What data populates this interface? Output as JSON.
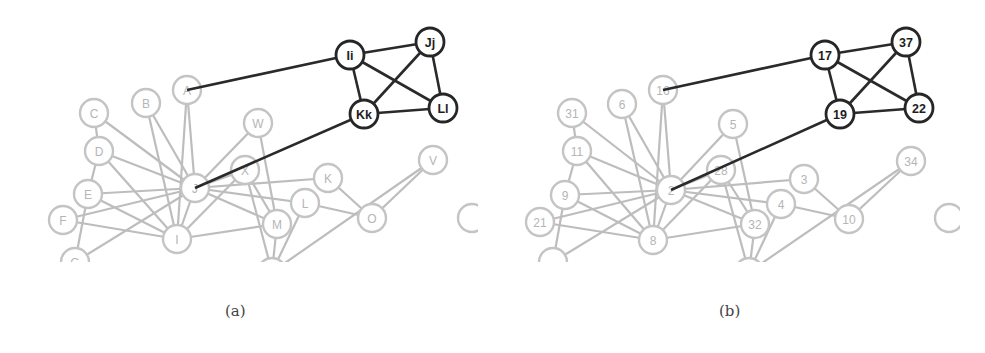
{
  "figure": {
    "colors": {
      "highlight": "#262626",
      "muted": "#c4c4c4",
      "muted_text": "#b5b5b5"
    },
    "panels": [
      {
        "id": "a",
        "caption": "(a)",
        "offset_x": 0,
        "nodes": [
          {
            "id": "Ii",
            "label": "Ii",
            "x": 350,
            "y": 55,
            "style": "dark"
          },
          {
            "id": "Jj",
            "label": "Jj",
            "x": 430,
            "y": 42,
            "style": "dark"
          },
          {
            "id": "Kk",
            "label": "Kk",
            "x": 364,
            "y": 114,
            "style": "dark"
          },
          {
            "id": "Ll",
            "label": "Ll",
            "x": 443,
            "y": 108,
            "style": "dark"
          },
          {
            "id": "A",
            "label": "A",
            "x": 187,
            "y": 90,
            "style": "gray"
          },
          {
            "id": "B",
            "label": "B",
            "x": 146,
            "y": 103,
            "style": "gray"
          },
          {
            "id": "C",
            "label": "C",
            "x": 94,
            "y": 113,
            "style": "gray"
          },
          {
            "id": "D",
            "label": "D",
            "x": 99,
            "y": 151,
            "style": "gray"
          },
          {
            "id": "E",
            "label": "E",
            "x": 88,
            "y": 194,
            "style": "gray"
          },
          {
            "id": "F",
            "label": "F",
            "x": 63,
            "y": 220,
            "style": "gray"
          },
          {
            "id": "J",
            "label": "J",
            "x": 195,
            "y": 188,
            "style": "gray"
          },
          {
            "id": "I",
            "label": "I",
            "x": 177,
            "y": 239,
            "style": "gray"
          },
          {
            "id": "W",
            "label": "W",
            "x": 258,
            "y": 123,
            "style": "gray"
          },
          {
            "id": "X",
            "label": "X",
            "x": 245,
            "y": 170,
            "style": "gray"
          },
          {
            "id": "K",
            "label": "K",
            "x": 328,
            "y": 178,
            "style": "gray"
          },
          {
            "id": "L",
            "label": "L",
            "x": 305,
            "y": 203,
            "style": "gray"
          },
          {
            "id": "M",
            "label": "M",
            "x": 277,
            "y": 224,
            "style": "gray"
          },
          {
            "id": "O",
            "label": "O",
            "x": 372,
            "y": 218,
            "style": "gray"
          },
          {
            "id": "V",
            "label": "V",
            "x": 433,
            "y": 160,
            "style": "gray"
          },
          {
            "id": "P",
            "label": "",
            "x": 472,
            "y": 218,
            "style": "gray"
          },
          {
            "id": "G",
            "label": "G",
            "x": 75,
            "y": 262,
            "style": "gray"
          },
          {
            "id": "N",
            "label": "",
            "x": 272,
            "y": 272,
            "style": "gray"
          }
        ],
        "dark_edges": [
          [
            "A",
            "Ii"
          ],
          [
            "Ii",
            "Jj"
          ],
          [
            "Ii",
            "Kk"
          ],
          [
            "Ii",
            "Ll"
          ],
          [
            "Jj",
            "Kk"
          ],
          [
            "Jj",
            "Ll"
          ],
          [
            "Kk",
            "Ll"
          ],
          [
            "J",
            "Kk"
          ]
        ],
        "gray_edges": [
          [
            "A",
            "J"
          ],
          [
            "A",
            "I"
          ],
          [
            "B",
            "J"
          ],
          [
            "B",
            "I"
          ],
          [
            "C",
            "D"
          ],
          [
            "C",
            "J"
          ],
          [
            "D",
            "E"
          ],
          [
            "D",
            "J"
          ],
          [
            "D",
            "I"
          ],
          [
            "E",
            "J"
          ],
          [
            "E",
            "I"
          ],
          [
            "E",
            "G"
          ],
          [
            "F",
            "J"
          ],
          [
            "F",
            "I"
          ],
          [
            "J",
            "I"
          ],
          [
            "J",
            "W"
          ],
          [
            "J",
            "X"
          ],
          [
            "J",
            "K"
          ],
          [
            "J",
            "L"
          ],
          [
            "J",
            "M"
          ],
          [
            "J",
            "G"
          ],
          [
            "I",
            "M"
          ],
          [
            "I",
            "X"
          ],
          [
            "W",
            "M"
          ],
          [
            "X",
            "M"
          ],
          [
            "X",
            "N"
          ],
          [
            "L",
            "O"
          ],
          [
            "L",
            "N"
          ],
          [
            "K",
            "O"
          ],
          [
            "M",
            "N"
          ],
          [
            "O",
            "V"
          ],
          [
            "V",
            "N"
          ]
        ]
      },
      {
        "id": "b",
        "caption": "(b)",
        "offset_x": 485,
        "nodes": [
          {
            "id": "n17",
            "label": "17",
            "x": 340,
            "y": 55,
            "style": "dark"
          },
          {
            "id": "n37",
            "label": "37",
            "x": 421,
            "y": 42,
            "style": "dark"
          },
          {
            "id": "n19",
            "label": "19",
            "x": 355,
            "y": 114,
            "style": "dark"
          },
          {
            "id": "n22",
            "label": "22",
            "x": 434,
            "y": 108,
            "style": "dark"
          },
          {
            "id": "n16",
            "label": "16",
            "x": 178,
            "y": 90,
            "style": "gray"
          },
          {
            "id": "n6",
            "label": "6",
            "x": 137,
            "y": 104,
            "style": "gray"
          },
          {
            "id": "n31",
            "label": "31",
            "x": 87,
            "y": 113,
            "style": "gray"
          },
          {
            "id": "n11",
            "label": "11",
            "x": 92,
            "y": 151,
            "style": "gray"
          },
          {
            "id": "n9",
            "label": "9",
            "x": 80,
            "y": 195,
            "style": "gray"
          },
          {
            "id": "n21",
            "label": "21",
            "x": 55,
            "y": 222,
            "style": "gray"
          },
          {
            "id": "n2",
            "label": "2",
            "x": 186,
            "y": 190,
            "style": "gray"
          },
          {
            "id": "n8",
            "label": "8",
            "x": 168,
            "y": 240,
            "style": "gray"
          },
          {
            "id": "n5",
            "label": "5",
            "x": 248,
            "y": 124,
            "style": "gray"
          },
          {
            "id": "n28",
            "label": "28",
            "x": 236,
            "y": 170,
            "style": "gray"
          },
          {
            "id": "n3",
            "label": "3",
            "x": 319,
            "y": 179,
            "style": "gray"
          },
          {
            "id": "n4",
            "label": "4",
            "x": 296,
            "y": 204,
            "style": "gray"
          },
          {
            "id": "n32",
            "label": "32",
            "x": 270,
            "y": 224,
            "style": "gray"
          },
          {
            "id": "n10",
            "label": "10",
            "x": 364,
            "y": 219,
            "style": "gray"
          },
          {
            "id": "n34",
            "label": "34",
            "x": 426,
            "y": 161,
            "style": "gray"
          },
          {
            "id": "nP",
            "label": "",
            "x": 464,
            "y": 218,
            "style": "gray"
          },
          {
            "id": "nG",
            "label": "",
            "x": 68,
            "y": 262,
            "style": "gray"
          },
          {
            "id": "nN",
            "label": "",
            "x": 264,
            "y": 272,
            "style": "gray"
          }
        ],
        "dark_edges": [
          [
            "n16",
            "n17"
          ],
          [
            "n17",
            "n37"
          ],
          [
            "n17",
            "n19"
          ],
          [
            "n17",
            "n22"
          ],
          [
            "n37",
            "n19"
          ],
          [
            "n37",
            "n22"
          ],
          [
            "n19",
            "n22"
          ],
          [
            "n2",
            "n19"
          ]
        ],
        "gray_edges": [
          [
            "n16",
            "n2"
          ],
          [
            "n16",
            "n8"
          ],
          [
            "n6",
            "n2"
          ],
          [
            "n6",
            "n8"
          ],
          [
            "n31",
            "n11"
          ],
          [
            "n31",
            "n2"
          ],
          [
            "n11",
            "n9"
          ],
          [
            "n11",
            "n2"
          ],
          [
            "n11",
            "n8"
          ],
          [
            "n9",
            "n2"
          ],
          [
            "n9",
            "n8"
          ],
          [
            "n9",
            "nG"
          ],
          [
            "n21",
            "n2"
          ],
          [
            "n21",
            "n8"
          ],
          [
            "n2",
            "n8"
          ],
          [
            "n2",
            "n5"
          ],
          [
            "n2",
            "n28"
          ],
          [
            "n2",
            "n3"
          ],
          [
            "n2",
            "n4"
          ],
          [
            "n2",
            "n32"
          ],
          [
            "n2",
            "nG"
          ],
          [
            "n8",
            "n32"
          ],
          [
            "n8",
            "n28"
          ],
          [
            "n5",
            "n32"
          ],
          [
            "n28",
            "n32"
          ],
          [
            "n28",
            "nN"
          ],
          [
            "n4",
            "n10"
          ],
          [
            "n4",
            "nN"
          ],
          [
            "n3",
            "n10"
          ],
          [
            "n32",
            "nN"
          ],
          [
            "n10",
            "n34"
          ],
          [
            "n34",
            "nN"
          ]
        ]
      }
    ]
  }
}
